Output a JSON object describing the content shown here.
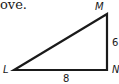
{
  "text_fragment": "ove.",
  "triangle": {
    "vertices": [
      {
        "name": "L",
        "x": 14,
        "y": 70
      },
      {
        "name": "M",
        "x": 107,
        "y": 14
      },
      {
        "name": "N",
        "x": 107,
        "y": 70
      }
    ],
    "side_labels": {
      "MN": "6",
      "LN": "8"
    },
    "right_angle_at": "N",
    "stroke_color": "#1a1a1a"
  },
  "labels": {
    "L": "L",
    "M": "M",
    "N": "N",
    "side_MN": "6",
    "side_LN": "8"
  }
}
